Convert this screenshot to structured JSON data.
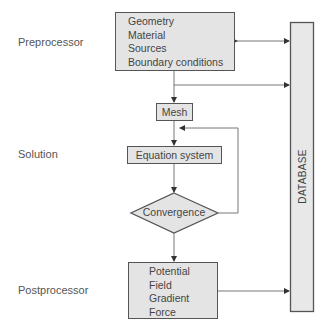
{
  "stages": {
    "preprocessor": "Preprocessor",
    "solution": "Solution",
    "postprocessor": "Postprocessor"
  },
  "preprocessor_box": {
    "items": [
      "Geometry",
      "Material",
      "Sources",
      "Boundary conditions"
    ]
  },
  "mesh_box": {
    "label": "Mesh"
  },
  "equation_box": {
    "label": "Equation system"
  },
  "convergence": {
    "label": "Convergence"
  },
  "postprocessor_box": {
    "items": [
      "Potential",
      "Field",
      "Gradient",
      "Force"
    ]
  },
  "database": {
    "label": "DATABASE"
  },
  "colors": {
    "box_fill": "#e4e4e4",
    "border": "#555555",
    "text": "#444444",
    "line": "#777777"
  }
}
